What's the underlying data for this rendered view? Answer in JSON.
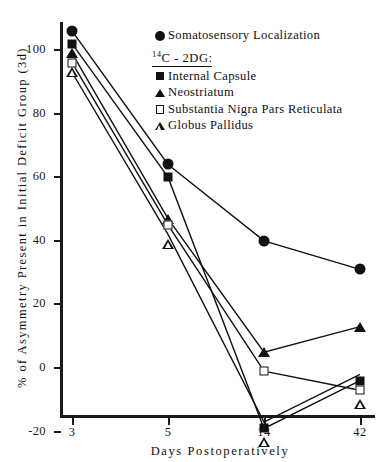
{
  "chart_data": {
    "type": "line",
    "title": "",
    "xlabel": "Days Postoperatively",
    "ylabel": "% of Asymmetry Present in Initial Deficit Group (3d)",
    "categories": [
      "3",
      "5",
      "14",
      "42"
    ],
    "ylim": [
      -20,
      110
    ],
    "yticks": [
      -20,
      0,
      20,
      40,
      60,
      80,
      100
    ],
    "ytick_labels": [
      "-20",
      "0",
      "20",
      "40",
      "60",
      "80",
      "100"
    ],
    "grid": false,
    "legend_position": "upper-right-inside",
    "series": [
      {
        "name": "Somatosensory Localization",
        "marker": "filled-circle",
        "values": [
          106,
          64,
          40,
          31
        ]
      },
      {
        "name": "Internal Capsule",
        "marker": "filled-square",
        "values": [
          102,
          60,
          -19,
          -4
        ]
      },
      {
        "name": "Neostriatum",
        "marker": "filled-triangle",
        "values": [
          99,
          47,
          5,
          13
        ]
      },
      {
        "name": "Substantia Nigra Pars Reticulata",
        "marker": "open-square",
        "values": [
          96,
          45,
          -1,
          -7
        ]
      },
      {
        "name": "Globus Pallidus",
        "marker": "open-triangle",
        "values": [
          93,
          42,
          -17,
          -2
        ]
      }
    ]
  },
  "legend": {
    "group_header": "C - 2DG:",
    "group_header_sup": "14",
    "entries": [
      {
        "label": "Somatosensory Localization",
        "marker": "filled-circle"
      },
      {
        "label": "Internal Capsule",
        "marker": "filled-square"
      },
      {
        "label": "Neostriatum",
        "marker": "filled-triangle"
      },
      {
        "label": "Substantia Nigra Pars Reticulata",
        "marker": "open-square"
      },
      {
        "label": "Globus Pallidus",
        "marker": "open-triangle"
      }
    ]
  },
  "colors": {
    "ink": "#111111",
    "background": "#ffffff"
  }
}
